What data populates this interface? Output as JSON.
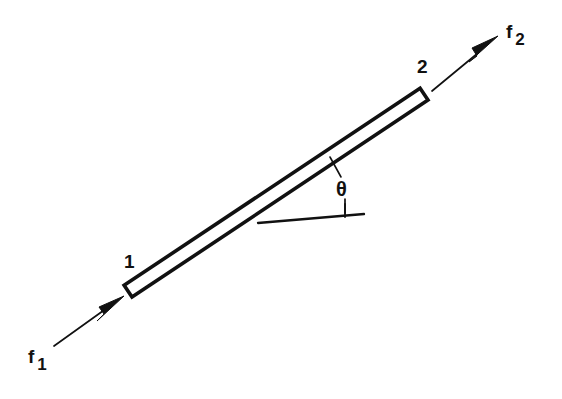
{
  "figure": {
    "domain": "diagram",
    "kind": "free-body-diagram",
    "background_color": "#ffffff",
    "stroke_color": "#111111",
    "fill_color": "#ffffff",
    "width": 562,
    "height": 399
  },
  "labels": {
    "node_1": "1",
    "node_2": "2",
    "force_1_symbol": "f",
    "force_1_subscript": "1",
    "force_2_symbol": "f",
    "force_2_subscript": "2",
    "angle": "θ"
  },
  "geometry": {
    "bar": {
      "node_1_x": 128,
      "node_1_y": 292,
      "node_2_x": 424,
      "node_2_y": 95,
      "thickness": 14,
      "inclination_deg": 33.6,
      "edge_stroke_width": 3.4
    },
    "force_1_arrow": {
      "tail_x": 54,
      "tail_y": 346,
      "tip_x": 124,
      "tip_y": 296,
      "shaft_width": 1.6,
      "head_length": 26,
      "head_half_width": 7
    },
    "force_2_arrow": {
      "tail_x": 432,
      "tail_y": 91,
      "tip_x": 498,
      "tip_y": 36,
      "shaft_width": 1.6,
      "head_length": 28,
      "head_half_width": 7.5
    },
    "reference_line": {
      "start_x": 258,
      "start_y": 223,
      "end_x": 364,
      "end_y": 214,
      "stroke_width": 2.2,
      "tick_x": 345,
      "tick_top_y": 204,
      "tick_bottom_y": 217
    },
    "angle_leader": {
      "start_x": 331,
      "start_y": 158,
      "end_x": 341,
      "end_y": 176,
      "stroke_width": 1.5
    },
    "theta_stem": {
      "x": 345,
      "top_y": 199,
      "bottom_y": 213,
      "stroke_width": 1.6
    }
  }
}
